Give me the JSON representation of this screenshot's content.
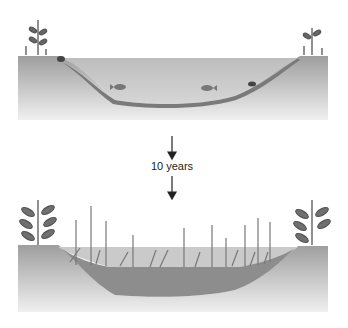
{
  "diagram": {
    "type": "succession-sequence",
    "stages": [
      {
        "id": "pond",
        "description": "Pond with water, fish, turtle, shoreline plants"
      },
      {
        "id": "marsh",
        "description": "Filled-in pond with sediment and tall marsh plants"
      }
    ],
    "transition": {
      "label": "10 years",
      "arrow": "down"
    },
    "colors": {
      "ground": "#a8a8a8",
      "ground_light": "#d8d8d8",
      "water": "#c4c4c4",
      "sediment": "#8a8a8a",
      "plants": "#6a6a6a",
      "arrow": "#222222"
    }
  }
}
